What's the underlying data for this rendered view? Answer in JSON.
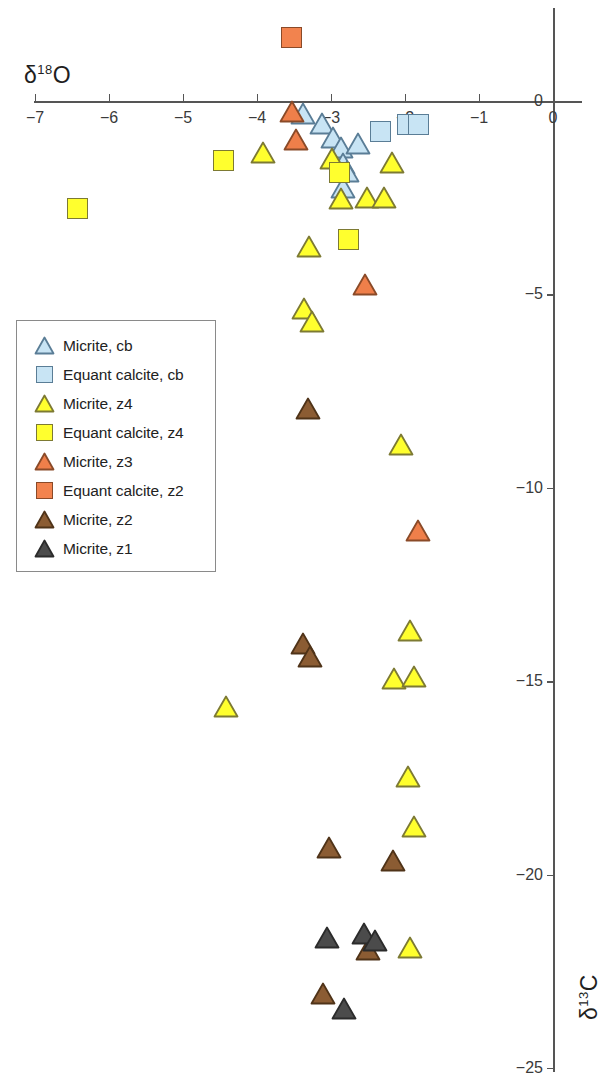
{
  "figure": {
    "type": "scatter",
    "x_axis": {
      "title_prefix": "δ",
      "title_sup": "18",
      "title_suffix": "O",
      "title": "δ18O",
      "ticks": [
        -7,
        -6,
        -5,
        -4,
        -3,
        -2,
        -1,
        0
      ],
      "tick_labels": [
        "-7",
        "-6",
        "-5",
        "-4",
        "-3",
        "-2",
        "-1",
        "0"
      ],
      "range": [
        -7,
        0
      ]
    },
    "y_axis": {
      "title_prefix": "δ",
      "title_sup": "13",
      "title_suffix": "C",
      "title": "δ13C",
      "ticks": [
        0,
        -5,
        -10,
        -15,
        -20,
        -25
      ],
      "tick_labels": [
        "0",
        "-5",
        "-10",
        "-15",
        "-20",
        "-25"
      ],
      "range": [
        -25,
        2.2
      ],
      "side": "right"
    }
  },
  "legend": {
    "items": [
      {
        "label": "Micrite, cb",
        "shape": "triangle",
        "fill": "#c8e4f4",
        "stroke": "#5a7d96",
        "series": "micrite_cb"
      },
      {
        "label": "Equant calcite, cb",
        "shape": "square",
        "fill": "#c8e4f4",
        "stroke": "#5a7d96",
        "series": "equant_cb"
      },
      {
        "label": "Micrite, z4",
        "shape": "triangle",
        "fill": "#ffff2e",
        "stroke": "#7d7a33",
        "series": "micrite_z4"
      },
      {
        "label": "Equant calcite, z4",
        "shape": "square",
        "fill": "#ffff2e",
        "stroke": "#7d7a33",
        "series": "equant_z4"
      },
      {
        "label": "Micrite, z3",
        "shape": "triangle",
        "fill": "#ef7f4a",
        "stroke": "#8a4a28",
        "series": "micrite_z3"
      },
      {
        "label": "Equant calcite, z2",
        "shape": "square",
        "fill": "#f2834e",
        "stroke": "#8a4a28",
        "series": "equant_z2"
      },
      {
        "label": "Micrite, z2",
        "shape": "triangle",
        "fill": "#8b5c33",
        "stroke": "#4f3318",
        "series": "micrite_z2"
      },
      {
        "label": "Micrite, z1",
        "shape": "triangle",
        "fill": "#4b4b4b",
        "stroke": "#2b2b2b",
        "series": "micrite_z1"
      }
    ]
  },
  "chart_data": {
    "type": "scatter",
    "title": "",
    "xlabel": "δ18O",
    "ylabel": "δ13C",
    "xlim": [
      -7,
      0
    ],
    "ylim": [
      -25,
      2.2
    ],
    "grid": false,
    "legend_position": "left-middle",
    "series": [
      {
        "name": "Micrite, cb",
        "shape": "triangle",
        "fill": "#c8e4f4",
        "stroke": "#5a7d96",
        "points": [
          [
            -3.38,
            -0.35
          ],
          [
            -3.12,
            -0.62
          ],
          [
            -2.97,
            -0.97
          ],
          [
            -2.86,
            -1.23
          ],
          [
            -2.64,
            -1.12
          ],
          [
            -2.84,
            -1.63
          ],
          [
            -2.78,
            -1.86
          ],
          [
            -2.84,
            -2.25
          ]
        ]
      },
      {
        "name": "Equant calcite, cb",
        "shape": "square",
        "fill": "#c8e4f4",
        "stroke": "#5a7d96",
        "points": [
          [
            -2.33,
            -0.78
          ],
          [
            -1.96,
            -0.62
          ],
          [
            -1.82,
            -0.62
          ]
        ]
      },
      {
        "name": "Micrite, z4",
        "shape": "triangle",
        "fill": "#ffff2e",
        "stroke": "#7d7a33",
        "points": [
          [
            -3.92,
            -1.35
          ],
          [
            -2.99,
            -1.52
          ],
          [
            -2.18,
            -1.62
          ],
          [
            -2.86,
            -2.55
          ],
          [
            -2.52,
            -2.52
          ],
          [
            -2.28,
            -2.52
          ],
          [
            -3.3,
            -3.8
          ],
          [
            -3.36,
            -5.38
          ],
          [
            -3.26,
            -5.72
          ],
          [
            -2.05,
            -8.91
          ],
          [
            -1.93,
            -13.72
          ],
          [
            -4.42,
            -15.68
          ],
          [
            -2.15,
            -14.95
          ],
          [
            -1.88,
            -14.9
          ],
          [
            -1.96,
            -17.5
          ],
          [
            -1.88,
            -18.79
          ],
          [
            -1.93,
            -21.9
          ]
        ]
      },
      {
        "name": "Equant calcite, z4",
        "shape": "square",
        "fill": "#ffff2e",
        "stroke": "#7d7a33",
        "points": [
          [
            -4.45,
            -1.53
          ],
          [
            -6.43,
            -2.77
          ],
          [
            -2.89,
            -1.85
          ],
          [
            -2.77,
            -3.57
          ]
        ]
      },
      {
        "name": "Micrite, z3",
        "shape": "triangle",
        "fill": "#ef7f4a",
        "stroke": "#8a4a28",
        "points": [
          [
            -3.53,
            -0.31
          ],
          [
            -3.47,
            -1.02
          ],
          [
            -2.54,
            -4.76
          ],
          [
            -1.82,
            -11.14
          ]
        ]
      },
      {
        "name": "Equant calcite, z2",
        "shape": "square",
        "fill": "#f2834e",
        "stroke": "#8a4a28",
        "points": [
          [
            -3.53,
            1.65
          ]
        ]
      },
      {
        "name": "Micrite, z2",
        "shape": "triangle",
        "fill": "#8b5c33",
        "stroke": "#4f3318",
        "points": [
          [
            -3.31,
            -7.98
          ],
          [
            -3.38,
            -14.05
          ],
          [
            -3.28,
            -14.38
          ],
          [
            -3.03,
            -19.33
          ],
          [
            -2.16,
            -19.66
          ],
          [
            -2.5,
            -21.95
          ],
          [
            -3.11,
            -23.1
          ]
        ]
      },
      {
        "name": "Micrite, z1",
        "shape": "triangle",
        "fill": "#4b4b4b",
        "stroke": "#2b2b2b",
        "points": [
          [
            -3.05,
            -21.65
          ],
          [
            -2.56,
            -21.55
          ],
          [
            -2.4,
            -21.72
          ],
          [
            -2.82,
            -23.5
          ]
        ]
      }
    ]
  }
}
